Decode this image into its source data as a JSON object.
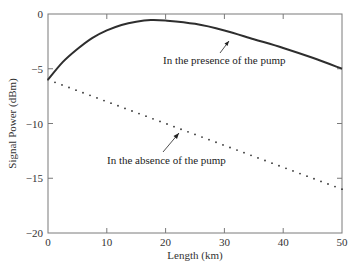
{
  "chart_data": {
    "type": "line",
    "title": "",
    "xlabel": "Length (km)",
    "ylabel": "Signal Power (dBm)",
    "xlim": [
      0,
      50
    ],
    "ylim": [
      -20,
      0
    ],
    "xticks": [
      0,
      10,
      20,
      30,
      40,
      50
    ],
    "yticks": [
      0,
      -5,
      -10,
      -15,
      -20
    ],
    "xtick_labels": [
      "0",
      "10",
      "20",
      "30",
      "40",
      "50"
    ],
    "ytick_labels": [
      "0",
      "−5",
      "−10",
      "−15",
      "−20"
    ],
    "grid": false,
    "legend": null,
    "series": [
      {
        "name": "In the presence of the pump",
        "style": "solid",
        "x": [
          0,
          2.5,
          5,
          7.5,
          10,
          12.5,
          15,
          17.5,
          20,
          25,
          30,
          35,
          40,
          45,
          50
        ],
        "y": [
          -6.0,
          -4.4,
          -3.2,
          -2.2,
          -1.5,
          -1.0,
          -0.7,
          -0.55,
          -0.6,
          -0.9,
          -1.5,
          -2.3,
          -3.1,
          -4.0,
          -5.0
        ]
      },
      {
        "name": "In the absence of the pump",
        "style": "dotted",
        "x": [
          0,
          50
        ],
        "y": [
          -6.0,
          -16.0
        ]
      }
    ],
    "annotations": [
      {
        "text": "In the presence of the pump",
        "arrow_to": [
          31,
          -1.6
        ]
      },
      {
        "text": "In the absence of the pump",
        "arrow_to": [
          23,
          -10.6
        ]
      }
    ]
  },
  "colors": {
    "curve": "#2e2e2e",
    "frame": "#7a7a7a",
    "dots": "#333333"
  }
}
